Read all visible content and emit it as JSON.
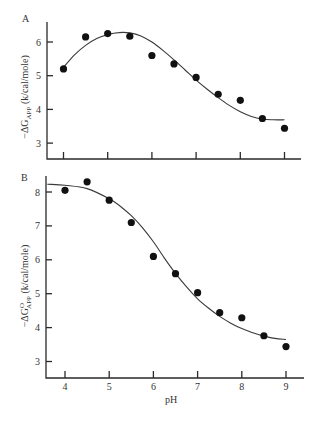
{
  "chart_data": [
    {
      "type": "scatter",
      "panel": "A",
      "title": "",
      "xlabel": "",
      "ylabel": "-ΔG_APP (k/cal/mole)",
      "ylabel_parts": {
        "prefix": "−ΔG",
        "sup": "",
        "sub": "APP",
        "suffix": " (k/cal/mole)"
      },
      "xlim": [
        3.6,
        9.4
      ],
      "ylim": [
        2.5,
        6.5
      ],
      "xticks": [
        4,
        5,
        6,
        7,
        8,
        9
      ],
      "yticks": [
        3,
        4,
        5,
        6
      ],
      "grid": false,
      "show_x_tick_labels": false,
      "series": [
        {
          "name": "measured",
          "marker": "filled-circle",
          "x": [
            4,
            4.5,
            5,
            5.5,
            6,
            6.5,
            7,
            7.5,
            8,
            8.5,
            9
          ],
          "y": [
            5.2,
            6.15,
            6.25,
            6.17,
            5.6,
            5.35,
            4.95,
            4.45,
            4.27,
            3.73,
            3.44
          ]
        },
        {
          "name": "fit",
          "style": "line",
          "x": [
            4,
            4.25,
            4.5,
            4.75,
            5,
            5.25,
            5.5,
            5.75,
            6,
            6.25,
            6.5,
            6.75,
            7,
            7.25,
            7.5,
            7.75,
            8,
            8.25,
            8.5,
            8.75,
            9
          ],
          "y": [
            5.25,
            5.62,
            5.9,
            6.1,
            6.22,
            6.28,
            6.27,
            6.18,
            6.0,
            5.75,
            5.47,
            5.17,
            4.87,
            4.6,
            4.35,
            4.12,
            3.93,
            3.79,
            3.71,
            3.69,
            3.69
          ]
        }
      ]
    },
    {
      "type": "scatter",
      "panel": "B",
      "title": "",
      "xlabel": "pH",
      "ylabel": "-ΔG°_APP (k/cal/mole)",
      "ylabel_parts": {
        "prefix": "−ΔG",
        "sup": "O",
        "sub": "APP",
        "suffix": " (k/cal/mole)"
      },
      "xlim": [
        3.6,
        9.4
      ],
      "ylim": [
        2.5,
        8.5
      ],
      "xticks": [
        4,
        5,
        6,
        7,
        8,
        9
      ],
      "yticks": [
        3,
        4,
        5,
        6,
        7,
        8
      ],
      "grid": false,
      "show_x_tick_labels": true,
      "series": [
        {
          "name": "measured",
          "marker": "filled-circle",
          "x": [
            4,
            4.5,
            5,
            5.5,
            6,
            6.5,
            7,
            7.5,
            8,
            8.5,
            9
          ],
          "y": [
            8.05,
            8.3,
            7.76,
            7.1,
            6.1,
            5.59,
            5.03,
            4.44,
            4.29,
            3.76,
            3.44
          ]
        },
        {
          "name": "fit",
          "style": "line",
          "x": [
            3.6,
            4,
            4.5,
            5,
            5.25,
            5.5,
            5.75,
            6,
            6.25,
            6.5,
            6.75,
            7,
            7.25,
            7.5,
            7.75,
            8,
            8.25,
            8.5,
            8.75,
            9
          ],
          "y": [
            8.23,
            8.2,
            8.1,
            7.8,
            7.58,
            7.3,
            6.95,
            6.53,
            6.05,
            5.6,
            5.2,
            4.85,
            4.57,
            4.33,
            4.13,
            3.97,
            3.85,
            3.75,
            3.68,
            3.65
          ]
        }
      ]
    }
  ],
  "panels": {
    "A": {
      "label": "A"
    },
    "B": {
      "label": "B"
    }
  },
  "x_axis": {
    "title": "pH"
  }
}
